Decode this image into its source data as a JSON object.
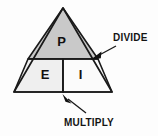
{
  "diagram": {
    "background_color": "#fdfdfd",
    "outline_color": "#1a1a1a",
    "segments": [
      {
        "id": "top",
        "label": "P",
        "fill_color": "#c9c9c9",
        "shape": "triangle"
      },
      {
        "id": "bottom-left",
        "label": "E",
        "fill_color": "#efefef",
        "shape": "quadrilateral"
      },
      {
        "id": "bottom-right",
        "label": "I",
        "fill_color": "#fbfbfb",
        "shape": "quadrilateral"
      }
    ],
    "callouts": [
      {
        "id": "divide",
        "label": "DIVIDE",
        "arrow_direction": "down-left",
        "points_to": "right-edge-of-horizontal-divider"
      },
      {
        "id": "multiply",
        "label": "MULTIPLY",
        "arrow_direction": "up-left",
        "points_to": "bottom-of-vertical-divider"
      }
    ]
  }
}
